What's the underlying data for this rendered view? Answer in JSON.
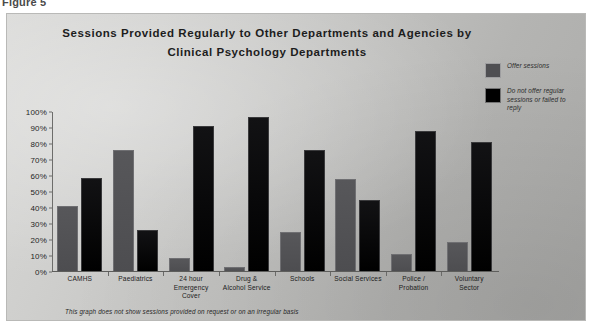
{
  "figure_label": "Figure 5",
  "footnote": "This graph does not show sessions provided on request or on an irregular basis",
  "legend": {
    "items": [
      {
        "label": "Offer sessions",
        "color": "#4f4f52",
        "icon": "legend-swatch-offer"
      },
      {
        "label": "Do not offer regular sessions or failed to reply",
        "color": "#000000",
        "icon": "legend-swatch-no-offer"
      }
    ]
  },
  "chart_data": {
    "type": "bar",
    "title": "Sessions Provided Regularly to Other Departments and Agencies by Clinical Psychology Departments",
    "title_line1": "Sessions Provided Regularly to Other Departments and Agencies by",
    "title_line2": "Clinical Psychology Departments",
    "xlabel": "",
    "ylabel": "",
    "ylim": [
      0,
      100
    ],
    "grid": false,
    "legend_position": "top-right",
    "ytick_labels": [
      "100%",
      "90%",
      "80%",
      "70%",
      "60%",
      "50%",
      "40%",
      "30%",
      "20%",
      "10%",
      "0%"
    ],
    "ytick_values": [
      100,
      90,
      80,
      70,
      60,
      50,
      40,
      30,
      20,
      10,
      0
    ],
    "categories": [
      "CAMHS",
      "Paediatrics",
      "24 hour Emergency Cover",
      "Drug & Alcohol Service",
      "Schools",
      "Social Services",
      "Police / Probation",
      "Voluntary Sector"
    ],
    "category_lines": [
      [
        "CAMHS"
      ],
      [
        "Paediatrics"
      ],
      [
        "24 hour",
        "Emergency",
        "Cover"
      ],
      [
        "Drug &",
        "Alcohol Service"
      ],
      [
        "Schools"
      ],
      [
        "Social Services"
      ],
      [
        "Police /",
        "Probation"
      ],
      [
        "Voluntary",
        "Sector"
      ]
    ],
    "series": [
      {
        "name": "Offer sessions",
        "color": "#4f4f52",
        "values": [
          41,
          76,
          9,
          3,
          25,
          58,
          11,
          19
        ]
      },
      {
        "name": "Do not offer regular sessions or failed to reply",
        "color": "#000000",
        "values": [
          59,
          26,
          91,
          97,
          76,
          45,
          88,
          81
        ]
      }
    ]
  }
}
